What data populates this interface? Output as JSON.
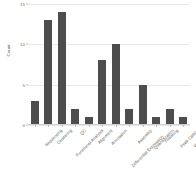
{
  "chart_data": {
    "type": "bar",
    "title": "",
    "xlabel": "",
    "ylabel": "Count",
    "ylim": [
      0,
      15
    ],
    "yticks": [
      0,
      5,
      10,
      15
    ],
    "ytick_labels": [
      "0",
      "5",
      "10",
      "15"
    ],
    "grid": true,
    "legend": null,
    "bar_color": "#4d4d4d",
    "categories": [
      "Sequencing",
      "Clustering",
      "Functional Analysis",
      "QC",
      "Alignment",
      "Annotation",
      "Differential Expression",
      "Assembly",
      "Quantification",
      "Trimming",
      "Peak Calling",
      "Visualization"
    ],
    "values": [
      3,
      13,
      14,
      2,
      1,
      8,
      10,
      2,
      5,
      1,
      2,
      1
    ]
  },
  "axes": {
    "y_axis_title": "Count"
  }
}
